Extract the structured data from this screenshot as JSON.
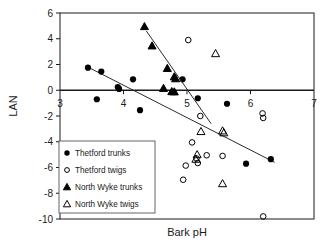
{
  "chart_data": {
    "type": "scatter",
    "title": "",
    "xlabel": "Bark pH",
    "ylabel": "LAN",
    "xlim": [
      3,
      7
    ],
    "ylim": [
      -10,
      6
    ],
    "xticks": [
      3,
      4,
      5,
      6,
      7
    ],
    "yticks": [
      6,
      4,
      2,
      0,
      -2,
      -4,
      -6,
      -8,
      -10
    ],
    "grid": false,
    "legend_position": "lower-left-inside",
    "zero_line": true,
    "series": [
      {
        "name": "Thetford trunks",
        "marker": "filled-circle",
        "points": [
          {
            "x": 3.44,
            "y": 1.75
          },
          {
            "x": 3.65,
            "y": 1.45
          },
          {
            "x": 3.58,
            "y": -0.7
          },
          {
            "x": 3.91,
            "y": 0.25
          },
          {
            "x": 3.93,
            "y": 0.1
          },
          {
            "x": 4.15,
            "y": 0.85
          },
          {
            "x": 4.26,
            "y": -1.55
          },
          {
            "x": 4.93,
            "y": 0.85
          },
          {
            "x": 5.17,
            "y": -0.62
          },
          {
            "x": 5.63,
            "y": -1.05
          },
          {
            "x": 5.93,
            "y": -5.7
          },
          {
            "x": 6.32,
            "y": -5.35
          }
        ],
        "trendline": {
          "x1": 3.42,
          "y1": 1.85,
          "x2": 6.38,
          "y2": -5.6
        }
      },
      {
        "name": "Thetford twigs",
        "marker": "open-circle",
        "points": [
          {
            "x": 5.02,
            "y": 3.9
          },
          {
            "x": 5.21,
            "y": -2.0
          },
          {
            "x": 5.08,
            "y": -4.05
          },
          {
            "x": 4.98,
            "y": -5.85
          },
          {
            "x": 5.15,
            "y": -5.3
          },
          {
            "x": 5.17,
            "y": -5.65
          },
          {
            "x": 5.31,
            "y": -5.05
          },
          {
            "x": 5.56,
            "y": -5.1
          },
          {
            "x": 4.94,
            "y": -6.95
          },
          {
            "x": 6.19,
            "y": -1.8
          },
          {
            "x": 6.2,
            "y": -2.15
          },
          {
            "x": 6.2,
            "y": -9.8
          }
        ]
      },
      {
        "name": "North Wyke trunks",
        "marker": "filled-triangle",
        "points": [
          {
            "x": 4.33,
            "y": 4.95
          },
          {
            "x": 4.45,
            "y": 3.45
          },
          {
            "x": 4.69,
            "y": 1.7
          },
          {
            "x": 4.8,
            "y": 1.05
          },
          {
            "x": 4.82,
            "y": 0.9
          },
          {
            "x": 4.63,
            "y": 0.15
          },
          {
            "x": 4.76,
            "y": -0.1
          },
          {
            "x": 4.8,
            "y": -0.12
          }
        ],
        "trendline": {
          "x1": 4.36,
          "y1": 4.6,
          "x2": 5.38,
          "y2": -2.6
        }
      },
      {
        "name": "North Wyke twigs",
        "marker": "open-triangle",
        "points": [
          {
            "x": 5.45,
            "y": 2.85
          },
          {
            "x": 5.22,
            "y": -3.2
          },
          {
            "x": 5.56,
            "y": -3.15
          },
          {
            "x": 5.58,
            "y": -3.3
          },
          {
            "x": 5.16,
            "y": -5.0
          },
          {
            "x": 5.14,
            "y": -5.35
          },
          {
            "x": 5.56,
            "y": -7.25
          }
        ]
      }
    ]
  },
  "legend": {
    "items": [
      {
        "label": "Thetford trunks",
        "marker": "filled-circle"
      },
      {
        "label": "Thetford twigs",
        "marker": "open-circle"
      },
      {
        "label": "North Wyke trunks",
        "marker": "filled-triangle"
      },
      {
        "label": "North Wyke twigs",
        "marker": "open-triangle"
      }
    ]
  },
  "colors": {
    "axis": "#1a1a1a",
    "marker": "#000000",
    "trendline": "#2b2b2b",
    "legend_border": "#555555",
    "background": "#ffffff"
  }
}
